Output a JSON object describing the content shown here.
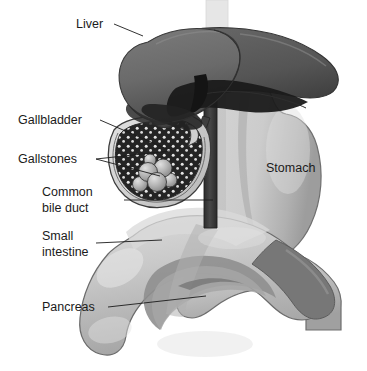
{
  "figure": {
    "background_color": "#ffffff",
    "width": 367,
    "height": 371
  },
  "labels": [
    {
      "id": "liver",
      "text": "Liver",
      "lines": [
        "Liver"
      ],
      "x": 76,
      "y": 28,
      "leader": "M 114 24 L 143 36"
    },
    {
      "id": "gallbladder",
      "text": "Gallbladder",
      "lines": [
        "Gallbladder"
      ],
      "x": 18,
      "y": 124,
      "leader": "M 100 120 L 167 149"
    },
    {
      "id": "gallstones",
      "text": "Gallstones",
      "lines": [
        "Gallstones"
      ],
      "x": 18,
      "y": 163,
      "leader": "M 96 159 L 170 151 M 96 159 L 160 176"
    },
    {
      "id": "common-bile-duct",
      "text": "Common bile duct",
      "lines": [
        "Common",
        "bile duct"
      ],
      "x": 42,
      "y": 203,
      "leader": "M 124 200 L 213 200"
    },
    {
      "id": "small-intestine",
      "text": "Small intestine",
      "lines": [
        "Small",
        "intestine"
      ],
      "x": 42,
      "y": 246,
      "leader": "M 96 243 L 162 240"
    },
    {
      "id": "pancreas",
      "text": "Pancreas",
      "lines": [
        "Pancreas"
      ],
      "x": 42,
      "y": 311,
      "leader": "M 108 307 L 206 296"
    },
    {
      "id": "stomach",
      "text": "Stomach",
      "lines": [
        "Stomach"
      ],
      "x": 266,
      "y": 172,
      "leader": ""
    }
  ],
  "organs": {
    "liver": {
      "name": "liver",
      "color_top": "#6f6f6f",
      "color_mid": "#5a5a5a",
      "color_dark": "#171717",
      "color_edge": "#3a3a3a"
    },
    "stomach": {
      "name": "stomach",
      "color_fill": "#c9c9c9",
      "color_shade": "#a9a9a9",
      "color_edge": "#6f6f6f"
    },
    "gallbladder": {
      "name": "gallbladder",
      "color_wall": "#d5d5d5",
      "color_lumen": "#2a2a2a",
      "color_speckle": "#e8e8e8",
      "color_edge": "#3c3c3c"
    },
    "gallstones": {
      "name": "gallstones",
      "count": 6,
      "color_fill": "#b4b4b4",
      "color_highlight": "#d8d8d8",
      "color_edge": "#3a3a3a",
      "stones": [
        {
          "cx": 148,
          "cy": 172,
          "r": 9.5
        },
        {
          "cx": 163,
          "cy": 168,
          "r": 9.0
        },
        {
          "cx": 157,
          "cy": 182,
          "r": 9.5
        },
        {
          "cx": 140,
          "cy": 184,
          "r": 7.5
        },
        {
          "cx": 170,
          "cy": 180,
          "r": 7.0
        },
        {
          "cx": 150,
          "cy": 160,
          "r": 6.0
        }
      ]
    },
    "common_bile_duct": {
      "name": "common-bile-duct",
      "color_fill": "#3c3c3c",
      "color_edge": "#202020"
    },
    "small_intestine": {
      "name": "small-intestine-duodenum",
      "color_fill": "#c6c6c6",
      "color_shade": "#9a9a9a",
      "color_edge": "#6b6b6b"
    },
    "pancreas": {
      "name": "pancreas",
      "color_fill": "#b8b8b8",
      "color_shade": "#8e8e8e",
      "color_edge": "#6b6b6b"
    },
    "esophagus": {
      "name": "esophagus",
      "color_fill": "#e4e4e4",
      "color_edge": "#cfcfcf"
    }
  }
}
